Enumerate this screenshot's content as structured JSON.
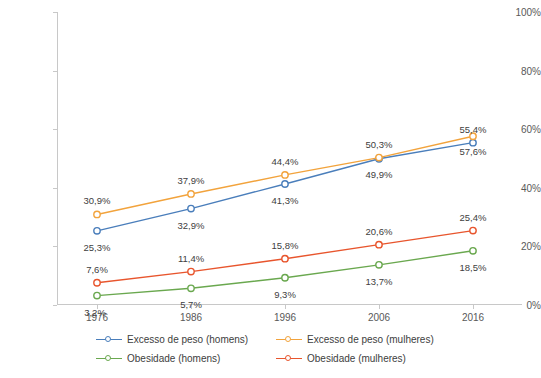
{
  "chart_data": {
    "type": "line",
    "title": "",
    "xlabel": "",
    "ylabel": "",
    "ylim": [
      0,
      100
    ],
    "grid": false,
    "legend_position": "bottom",
    "categories": [
      "1976",
      "1986",
      "1996",
      "2006",
      "2016"
    ],
    "y_ticks": [
      "0%",
      "20%",
      "40%",
      "60%",
      "80%",
      "100%"
    ],
    "y_tick_values": [
      0,
      20,
      40,
      60,
      80,
      100
    ],
    "series": [
      {
        "name": "Excesso de peso (homens)",
        "color": "#4a7ebb",
        "values": [
          25.3,
          32.9,
          41.3,
          49.9,
          55.4
        ],
        "labels": [
          "25,3%",
          "32,9%",
          "41,3%",
          "49,9%",
          "55,4%"
        ]
      },
      {
        "name": "Excesso de peso (mulheres)",
        "color": "#f2a33c",
        "values": [
          30.9,
          37.9,
          44.4,
          50.3,
          57.6
        ],
        "labels": [
          "30,9%",
          "37,9%",
          "44,4%",
          "50,3%",
          "57,6%"
        ]
      },
      {
        "name": "Obesidade (homens)",
        "color": "#6aa84f",
        "values": [
          3.2,
          5.7,
          9.3,
          13.7,
          18.5
        ],
        "labels": [
          "3,2%",
          "5,7%",
          "9,3%",
          "13,7%",
          "18,5%"
        ]
      },
      {
        "name": "Obesidade (mulheres)",
        "color": "#e8552d",
        "values": [
          7.6,
          11.4,
          15.8,
          20.6,
          25.4
        ],
        "labels": [
          "7,6%",
          "11,4%",
          "15,8%",
          "20,6%",
          "25,4%"
        ]
      }
    ]
  }
}
